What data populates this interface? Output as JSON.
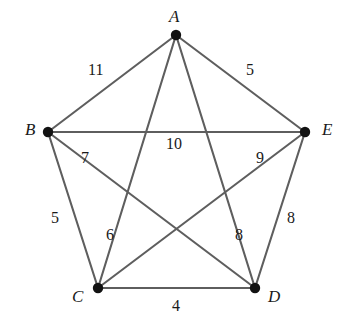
{
  "figure": {
    "type": "weighted-complete-graph-K5",
    "background_color": "#ffffff",
    "edge_color": "#5e5e5e",
    "vertex_color": "#121212",
    "label_color": "#1a1a1a"
  },
  "chart_data": {
    "type": "diagram",
    "title": "",
    "nodes": [
      {
        "id": "A",
        "label": "A",
        "x": 176,
        "y": 35,
        "label_x": 169,
        "label_y": 8
      },
      {
        "id": "B",
        "label": "B",
        "x": 48,
        "y": 132,
        "label_x": 25,
        "label_y": 121
      },
      {
        "id": "C",
        "label": "C",
        "x": 98,
        "y": 288,
        "label_x": 72,
        "label_y": 288
      },
      {
        "id": "D",
        "label": "D",
        "x": 255,
        "y": 288,
        "label_x": 268,
        "label_y": 288
      },
      {
        "id": "E",
        "label": "E",
        "x": 305,
        "y": 132,
        "label_x": 322,
        "label_y": 121
      }
    ],
    "edges": [
      {
        "from": "A",
        "to": "B",
        "weight": "11",
        "label_x": 88,
        "label_y": 62
      },
      {
        "from": "A",
        "to": "E",
        "weight": "5",
        "label_x": 246,
        "label_y": 62
      },
      {
        "from": "B",
        "to": "E",
        "weight": "10",
        "label_x": 166,
        "label_y": 136
      },
      {
        "from": "B",
        "to": "D",
        "weight": "7",
        "label_x": 81,
        "label_y": 150
      },
      {
        "from": "C",
        "to": "E",
        "weight": "9",
        "label_x": 256,
        "label_y": 150
      },
      {
        "from": "B",
        "to": "C",
        "weight": "5",
        "label_x": 51,
        "label_y": 210
      },
      {
        "from": "D",
        "to": "E",
        "weight": "8",
        "label_x": 287,
        "label_y": 210
      },
      {
        "from": "A",
        "to": "C",
        "weight": "6",
        "label_x": 106,
        "label_y": 227
      },
      {
        "from": "A",
        "to": "D",
        "weight": "8",
        "label_x": 235,
        "label_y": 227
      },
      {
        "from": "C",
        "to": "D",
        "weight": "4",
        "label_x": 172,
        "label_y": 298
      }
    ]
  }
}
